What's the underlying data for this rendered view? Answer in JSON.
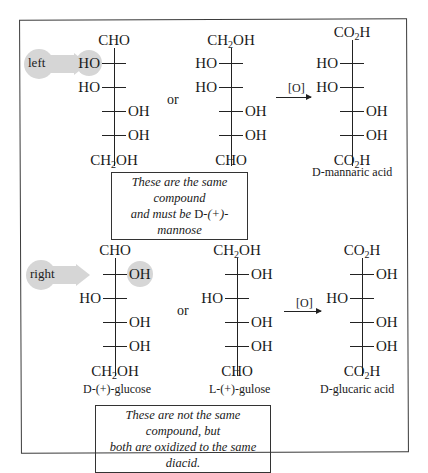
{
  "top_panel": {
    "pointer_label": "left",
    "structure1": {
      "top": "CHO",
      "rows": [
        {
          "side": "left",
          "group": "HO",
          "highlight": true
        },
        {
          "side": "left",
          "group": "HO",
          "highlight": false
        },
        {
          "side": "right",
          "group": "OH",
          "highlight": false
        },
        {
          "side": "right",
          "group": "OH",
          "highlight": false
        }
      ],
      "bottom": "CH2OH"
    },
    "or_label": "or",
    "structure2": {
      "top": "CH2OH",
      "rows": [
        {
          "side": "left",
          "group": "HO"
        },
        {
          "side": "left",
          "group": "HO"
        },
        {
          "side": "right",
          "group": "OH"
        },
        {
          "side": "right",
          "group": "OH"
        }
      ],
      "bottom": "CHO"
    },
    "reagent": "[O]",
    "product": {
      "top": "CO2H",
      "rows": [
        {
          "side": "left",
          "group": "HO"
        },
        {
          "side": "left",
          "group": "HO"
        },
        {
          "side": "right",
          "group": "OH"
        },
        {
          "side": "right",
          "group": "OH"
        }
      ],
      "bottom": "CO2H",
      "name_prefix": "D",
      "name_rest": "-mannaric acid"
    },
    "note_line1": "These are the same compound",
    "note_line2_pre": "and must be ",
    "note_line2_sc": "D",
    "note_line2_post": "-(+)-mannose"
  },
  "bottom_panel": {
    "pointer_label": "right",
    "structure1": {
      "top": "CHO",
      "rows": [
        {
          "side": "right",
          "group": "OH",
          "highlight": true
        },
        {
          "side": "left",
          "group": "HO",
          "highlight": false
        },
        {
          "side": "right",
          "group": "OH",
          "highlight": false
        },
        {
          "side": "right",
          "group": "OH",
          "highlight": false
        }
      ],
      "bottom": "CH2OH",
      "name_prefix": "D",
      "name_rest": "-(+)-glucose"
    },
    "or_label": "or",
    "structure2": {
      "top": "CH2OH",
      "rows": [
        {
          "side": "right",
          "group": "OH"
        },
        {
          "side": "left",
          "group": "HO"
        },
        {
          "side": "right",
          "group": "OH"
        },
        {
          "side": "right",
          "group": "OH"
        }
      ],
      "bottom": "CHO",
      "name_prefix": "L",
      "name_rest": "-(+)-gulose"
    },
    "reagent": "[O]",
    "product": {
      "top": "CO2H",
      "rows": [
        {
          "side": "right",
          "group": "OH"
        },
        {
          "side": "left",
          "group": "HO"
        },
        {
          "side": "right",
          "group": "OH"
        },
        {
          "side": "right",
          "group": "OH"
        }
      ],
      "bottom": "CO2H",
      "name_prefix": "D",
      "name_rest": "-glucaric acid"
    },
    "note_line1": "These are not the same compound, but",
    "note_line2": "both are oxidized to the same diacid."
  }
}
